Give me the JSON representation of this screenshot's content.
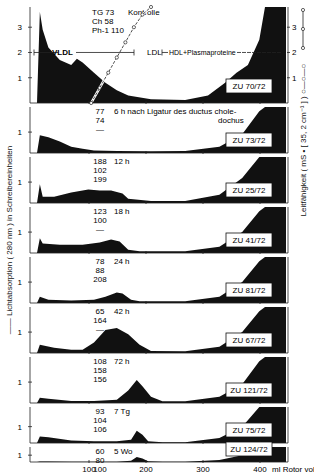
{
  "figure": {
    "y_label_left": "—— Lichtabsorption ( 280 nm )  in Schreibereinheiten",
    "y_label_right": "Leitfähigkeit ( mS • [ 35, 2 cm⁻¹ ] ) ○—○—○",
    "x_label": "ml Rotor vol.",
    "x_ticks": [
      "100",
      "200",
      "300",
      "400"
    ]
  },
  "chart_data": {
    "type": "area",
    "title": "",
    "xlabel": "ml Rotor vol.",
    "ylabel": "Lichtabsorption (280 nm) in Schreibereinheiten",
    "ylabel_right": "Leitfähigkeit (mS · [35,2 cm⁻¹])",
    "xlim": [
      0,
      430
    ],
    "x_ticks": [
      100,
      200,
      300,
      400
    ],
    "grid": false,
    "region_labels": [
      {
        "label": "VLDL",
        "x_range": [
          5,
          140
        ]
      },
      {
        "label": "LDL",
        "x_range": [
          140,
          240
        ]
      },
      {
        "label": "HDL+Plasmaproteine",
        "x_range": [
          260,
          420
        ]
      }
    ],
    "panels": [
      {
        "id": "ZU 70/72",
        "condition": "Kontrolle",
        "values_text": [
          "TG 73",
          "Ch 58",
          "Ph-1 110"
        ],
        "TG": 73,
        "Ch": 58,
        "Ph": 110,
        "ylim": [
          0,
          3.5
        ],
        "y_ticks": [
          1,
          2,
          3
        ],
        "right_y_ticks": [
          1,
          2,
          3
        ],
        "x": [
          0,
          5,
          10,
          20,
          40,
          60,
          70,
          80,
          100,
          120,
          140,
          160,
          200,
          260,
          300,
          330,
          350,
          370,
          390,
          400
        ],
        "y": [
          0,
          3.6,
          2.9,
          2.2,
          1.7,
          1.5,
          1.75,
          1.6,
          1.2,
          0.8,
          0.5,
          0.3,
          0.15,
          0.12,
          0.3,
          0.8,
          1.2,
          1.5,
          2.5,
          3.8
        ],
        "conductivity": {
          "x": [
            95,
            110,
            125,
            140,
            155,
            170,
            185,
            200
          ],
          "y": [
            0,
            0.6,
            1.2,
            1.8,
            2.4,
            3.0,
            3.5,
            3.8
          ]
        }
      },
      {
        "id": "ZU 73/72",
        "condition": "6 h nach Ligatur des ductus choledochus",
        "values_text": [
          "77",
          "74",
          "—"
        ],
        "TG": 77,
        "Ch": 74,
        "Ph": null,
        "y_ticks": [
          1
        ],
        "x": [
          0,
          5,
          20,
          40,
          60,
          80,
          100,
          140,
          200,
          260,
          320,
          360,
          390,
          400
        ],
        "y": [
          0,
          0.85,
          0.75,
          0.55,
          0.3,
          0.2,
          0.12,
          0.1,
          0.08,
          0.1,
          0.3,
          0.9,
          2.0,
          2.2
        ]
      },
      {
        "id": "ZU 25/72",
        "condition": "12 h",
        "values_text": [
          "188",
          "102",
          "199"
        ],
        "TG": 188,
        "Ch": 102,
        "Ph": 199,
        "y_ticks": [
          1
        ],
        "x": [
          0,
          5,
          10,
          30,
          60,
          90,
          110,
          130,
          150,
          160,
          200,
          260,
          320,
          360,
          390,
          400
        ],
        "y": [
          0,
          0.9,
          0.3,
          0.3,
          0.5,
          0.65,
          0.6,
          0.6,
          0.45,
          0.2,
          0.1,
          0.1,
          0.4,
          1.2,
          2.2,
          2.2
        ]
      },
      {
        "id": "ZU 41/72",
        "condition": "18 h",
        "values_text": [
          "123",
          "100",
          "—"
        ],
        "TG": 123,
        "Ch": 100,
        "Ph": null,
        "y_ticks": [
          1
        ],
        "x": [
          0,
          5,
          10,
          40,
          80,
          110,
          130,
          145,
          160,
          180,
          260,
          320,
          360,
          390,
          400
        ],
        "y": [
          0,
          0.7,
          0.45,
          0.4,
          0.4,
          0.5,
          0.65,
          0.55,
          0.15,
          0.08,
          0.08,
          0.3,
          1.0,
          2.0,
          2.2
        ]
      },
      {
        "id": "ZU 81/72",
        "condition": "24 h",
        "values_text": [
          "78",
          "88",
          "208"
        ],
        "TG": 78,
        "Ch": 88,
        "Ph": 208,
        "y_ticks": [
          1
        ],
        "x": [
          0,
          5,
          20,
          60,
          100,
          120,
          140,
          150,
          165,
          180,
          260,
          320,
          360,
          390,
          400
        ],
        "y": [
          0,
          0.3,
          0.15,
          0.12,
          0.15,
          0.3,
          0.5,
          0.45,
          0.15,
          0.08,
          0.08,
          0.3,
          1.0,
          2.0,
          2.2
        ]
      },
      {
        "id": "ZU 67/72",
        "condition": "42 h",
        "values_text": [
          "65",
          "164",
          "—"
        ],
        "TG": 65,
        "Ch": 164,
        "Ph": null,
        "y_ticks": [
          1
        ],
        "x": [
          0,
          5,
          30,
          60,
          80,
          100,
          120,
          140,
          160,
          180,
          200,
          260,
          320,
          360,
          390,
          400
        ],
        "y": [
          0,
          0.4,
          0.25,
          0.15,
          0.15,
          0.5,
          1.1,
          1.2,
          0.9,
          0.4,
          0.1,
          0.08,
          0.3,
          1.0,
          2.0,
          2.2
        ]
      },
      {
        "id": "ZU 121/72",
        "condition": "72 h",
        "values_text": [
          "108",
          "158",
          "156"
        ],
        "TG": 108,
        "Ch": 158,
        "Ph": 156,
        "y_ticks": [
          1
        ],
        "x": [
          0,
          5,
          20,
          60,
          100,
          140,
          160,
          175,
          185,
          200,
          220,
          260,
          320,
          360,
          390,
          400
        ],
        "y": [
          0,
          0.25,
          0.2,
          0.1,
          0.1,
          0.15,
          0.6,
          1.1,
          0.8,
          0.3,
          0.08,
          0.08,
          0.3,
          0.9,
          2.0,
          2.2
        ]
      },
      {
        "id": "ZU 75/72",
        "condition": "7 Tg",
        "values_text": [
          "93",
          "104",
          "106"
        ],
        "TG": 93,
        "Ch": 104,
        "Ph": 106,
        "y_ticks": [
          1
        ],
        "x": [
          0,
          5,
          20,
          60,
          100,
          140,
          165,
          175,
          185,
          195,
          220,
          260,
          320,
          360,
          390,
          400
        ],
        "y": [
          0,
          0.4,
          0.35,
          0.15,
          0.1,
          0.1,
          0.2,
          0.75,
          0.5,
          0.1,
          0.05,
          0.05,
          0.3,
          1.0,
          2.2,
          2.2
        ]
      },
      {
        "id": "ZU 124/72",
        "condition": "5 Wo",
        "values_text": [
          "60",
          "80",
          "100"
        ],
        "TG": 60,
        "Ch": 80,
        "Ph": 100,
        "y_ticks": [
          1
        ],
        "x": [
          0,
          5,
          20,
          60,
          100,
          140,
          165,
          175,
          185,
          195,
          220,
          260,
          320,
          360,
          390,
          400
        ],
        "y": [
          0,
          0.08,
          0.06,
          0.05,
          0.05,
          0.05,
          0.2,
          0.75,
          0.5,
          0.1,
          0.05,
          0.05,
          0.3,
          1.0,
          2.2,
          2.2
        ]
      }
    ]
  }
}
